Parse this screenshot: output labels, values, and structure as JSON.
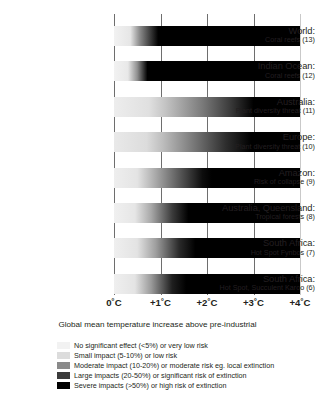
{
  "chart_data": {
    "type": "bar",
    "title": "",
    "xlabel": "Global mean temperature increase above pre-industrial",
    "ylabel": "",
    "xlim": [
      0,
      4
    ],
    "grid": true,
    "legend_position": "bottom",
    "xticks": [
      "0˚C",
      "+1˚C",
      "+2˚C",
      "+3˚C",
      "+4˚C"
    ],
    "xtick_values": [
      0,
      1,
      2,
      3,
      4
    ],
    "categories": [
      "World: Coral reefs (13)",
      "Indian Ocean: Coral reefs (12)",
      "Australia: Plant diversity threat (11)",
      "Europe: Plant diversity threat (10)",
      "Amazon: Risk of collapse (9)",
      "Australia, Queensland: Tropical forests (8)",
      "South Africa: Hot Spot Fynbos (7)",
      "South Africa: Hot Spot, Succulent Karoo (6)"
    ],
    "rows": [
      {
        "region": "World:",
        "detail": "Coral reefs (13)",
        "index": 13,
        "stops": [
          {
            "t": 0.0,
            "shade": "#f2f2f2"
          },
          {
            "t": 0.35,
            "shade": "#e6e6e6"
          },
          {
            "t": 0.55,
            "shade": "#8c8c8c"
          },
          {
            "t": 0.95,
            "shade": "#000000"
          },
          {
            "t": 4.0,
            "shade": "#000000"
          }
        ],
        "severe_onset_c": 0.95
      },
      {
        "region": "Indian Ocean:",
        "detail": "Coral reefs (12)",
        "index": 12,
        "stops": [
          {
            "t": 0.0,
            "shade": "#f2f2f2"
          },
          {
            "t": 0.3,
            "shade": "#e8e8e8"
          },
          {
            "t": 0.5,
            "shade": "#909090"
          },
          {
            "t": 0.72,
            "shade": "#000000"
          },
          {
            "t": 4.0,
            "shade": "#000000"
          }
        ],
        "severe_onset_c": 0.72
      },
      {
        "region": "Australia:",
        "detail": "Plant diversity threat (11)",
        "index": 11,
        "stops": [
          {
            "t": 0.0,
            "shade": "#ededed"
          },
          {
            "t": 0.75,
            "shade": "#e0e0e0"
          },
          {
            "t": 1.1,
            "shade": "#c4c4c4"
          },
          {
            "t": 1.9,
            "shade": "#7a7a7a"
          },
          {
            "t": 2.5,
            "shade": "#3a3a3a"
          },
          {
            "t": 3.0,
            "shade": "#000000"
          },
          {
            "t": 4.0,
            "shade": "#000000"
          }
        ],
        "severe_onset_c": 3.0
      },
      {
        "region": "Europe:",
        "detail": "Plant diversity threat (10)",
        "index": 10,
        "stops": [
          {
            "t": 0.0,
            "shade": "#e9e9e9"
          },
          {
            "t": 0.7,
            "shade": "#dcdcdc"
          },
          {
            "t": 1.05,
            "shade": "#bdbdbd"
          },
          {
            "t": 1.8,
            "shade": "#6f6f6f"
          },
          {
            "t": 2.4,
            "shade": "#2e2e2e"
          },
          {
            "t": 2.95,
            "shade": "#000000"
          },
          {
            "t": 4.0,
            "shade": "#000000"
          }
        ],
        "severe_onset_c": 2.95
      },
      {
        "region": "Amazon:",
        "detail": "Risk of collapse (9)",
        "index": 9,
        "stops": [
          {
            "t": 0.0,
            "shade": "#eeeeee"
          },
          {
            "t": 0.5,
            "shade": "#e4e4e4"
          },
          {
            "t": 0.85,
            "shade": "#b0b0b0"
          },
          {
            "t": 1.4,
            "shade": "#5a5a5a"
          },
          {
            "t": 1.9,
            "shade": "#0d0d0d"
          },
          {
            "t": 2.1,
            "shade": "#000000"
          },
          {
            "t": 4.0,
            "shade": "#000000"
          }
        ],
        "severe_onset_c": 2.1
      },
      {
        "region": "Australia, Queensland:",
        "detail": "Tropical forests (8)",
        "index": 8,
        "stops": [
          {
            "t": 0.0,
            "shade": "#f0f0f0"
          },
          {
            "t": 0.45,
            "shade": "#e6e6e6"
          },
          {
            "t": 0.8,
            "shade": "#a8a8a8"
          },
          {
            "t": 1.25,
            "shade": "#3c3c3c"
          },
          {
            "t": 1.6,
            "shade": "#000000"
          },
          {
            "t": 4.0,
            "shade": "#000000"
          }
        ],
        "severe_onset_c": 1.6
      },
      {
        "region": "South Africa:",
        "detail": "Hot Spot Fynbos  (7)",
        "index": 7,
        "stops": [
          {
            "t": 0.0,
            "shade": "#efefef"
          },
          {
            "t": 0.5,
            "shade": "#e3e3e3"
          },
          {
            "t": 0.9,
            "shade": "#9e9e9e"
          },
          {
            "t": 1.4,
            "shade": "#2a2a2a"
          },
          {
            "t": 1.75,
            "shade": "#000000"
          },
          {
            "t": 4.0,
            "shade": "#000000"
          }
        ],
        "severe_onset_c": 1.75
      },
      {
        "region": "South Africa:",
        "detail": "Hot Spot, Succulent Karoo (6)",
        "index": 6,
        "stops": [
          {
            "t": 0.0,
            "shade": "#efefef"
          },
          {
            "t": 0.45,
            "shade": "#e4e4e4"
          },
          {
            "t": 0.8,
            "shade": "#9a9a9a"
          },
          {
            "t": 1.25,
            "shade": "#1f1f1f"
          },
          {
            "t": 1.55,
            "shade": "#000000"
          },
          {
            "t": 4.0,
            "shade": "#000000"
          }
        ],
        "severe_onset_c": 1.55
      }
    ],
    "legend": [
      {
        "color": "#f2f2f2",
        "label": "No significant effect (<5%) or very low risk"
      },
      {
        "color": "#dcdcdc",
        "label": "Small impact (5-10%) or low risk"
      },
      {
        "color": "#8a8a8a",
        "label": "Moderate impact (10-20%) or moderate risk eg. local extinction"
      },
      {
        "color": "#3b3b3b",
        "label": "Large impacts (20-50%) or significant risk of extinction"
      },
      {
        "color": "#000000",
        "label": "Severe impacts (>50%) or high risk of extinction"
      }
    ]
  }
}
